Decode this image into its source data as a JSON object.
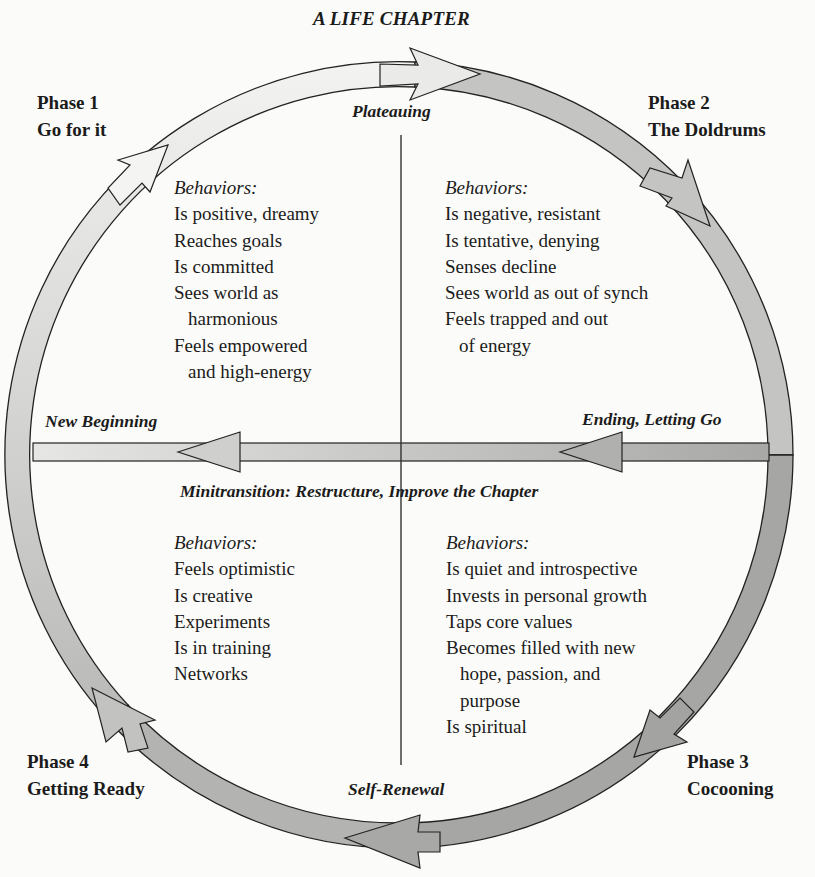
{
  "title": "A LIFE CHAPTER",
  "phases": [
    {
      "id": "phase-1",
      "number_label": "Phase 1",
      "name": "Go for it"
    },
    {
      "id": "phase-2",
      "number_label": "Phase 2",
      "name": "The Doldrums"
    },
    {
      "id": "phase-3",
      "number_label": "Phase 3",
      "name": "Cocooning"
    },
    {
      "id": "phase-4",
      "number_label": "Phase 4",
      "name": "Getting Ready"
    }
  ],
  "stages": {
    "top": "Plateauing",
    "right": "Ending, Letting Go",
    "left": "New Beginning",
    "bottom": "Self-Renewal",
    "center": "Minitransition: Restructure, Improve the Chapter"
  },
  "quadrants": {
    "top_left": {
      "heading": "Behaviors:",
      "lines": [
        {
          "text": "Is positive, dreamy",
          "indent": false
        },
        {
          "text": "Reaches goals",
          "indent": false
        },
        {
          "text": "Is committed",
          "indent": false
        },
        {
          "text": "Sees world as",
          "indent": false
        },
        {
          "text": "harmonious",
          "indent": true
        },
        {
          "text": "Feels empowered",
          "indent": false
        },
        {
          "text": "and high-energy",
          "indent": true
        }
      ]
    },
    "top_right": {
      "heading": "Behaviors:",
      "lines": [
        {
          "text": "Is negative, resistant",
          "indent": false
        },
        {
          "text": "Is tentative, denying",
          "indent": false
        },
        {
          "text": "Senses decline",
          "indent": false
        },
        {
          "text": "Sees world as out of synch",
          "indent": false
        },
        {
          "text": "Feels trapped and out",
          "indent": false
        },
        {
          "text": "of energy",
          "indent": true
        }
      ]
    },
    "bottom_left": {
      "heading": "Behaviors:",
      "lines": [
        {
          "text": "Feels optimistic",
          "indent": false
        },
        {
          "text": "Is creative",
          "indent": false
        },
        {
          "text": "Experiments",
          "indent": false
        },
        {
          "text": "Is in training",
          "indent": false
        },
        {
          "text": "Networks",
          "indent": false
        }
      ]
    },
    "bottom_right": {
      "heading": "Behaviors:",
      "lines": [
        {
          "text": "Is quiet and introspective",
          "indent": false
        },
        {
          "text": "Invests in personal growth",
          "indent": false
        },
        {
          "text": "Taps core values",
          "indent": false
        },
        {
          "text": "Becomes filled with new",
          "indent": false
        },
        {
          "text": "hope, passion, and",
          "indent": true
        },
        {
          "text": "purpose",
          "indent": true
        },
        {
          "text": "Is spiritual",
          "indent": false
        }
      ]
    }
  },
  "colors": {
    "ink": "#1b1b1b",
    "arc_light": "#ececea",
    "arc_mid": "#cfcfcd",
    "arc_dark": "#9e9e9c",
    "paper": "#fbfbf9"
  }
}
